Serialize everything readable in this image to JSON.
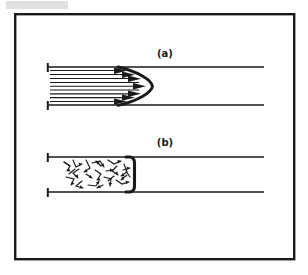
{
  "figure": {
    "background_color": "#ffffff",
    "ink_color": "#161616",
    "frame": {
      "name": "outer-border",
      "x": 14,
      "y": 13,
      "width": 281,
      "height": 247,
      "stroke_width": 2.4,
      "color": "#1a1a1a"
    },
    "panels": [
      {
        "id": "a",
        "label": "(a)",
        "flow_type": "laminar",
        "description": "Parabolic velocity profile with straight parallel streamlines and arrowheads forming a pointed parabolic front",
        "label_position": {
          "x": 165,
          "y": 57
        },
        "pipe": {
          "x_start": 47,
          "x_end": 264,
          "wall_top_y": 67,
          "wall_bottom_y": 105,
          "wall_stroke_width": 1.5,
          "end_tick_height": 9
        },
        "profile": {
          "shape": "parabola",
          "apex_x": 152,
          "base_x": 118,
          "stroke_width": 2.8
        },
        "streamlines": {
          "count": 9,
          "x_start": 50,
          "stroke_width": 1.2,
          "arrow_count": 7
        }
      },
      {
        "id": "b",
        "label": "(b)",
        "flow_type": "turbulent",
        "description": "Blunt flat-topped velocity profile with chaotic zigzag eddy arrows pointing in random directions",
        "label_position": {
          "x": 165,
          "y": 146
        },
        "pipe": {
          "x_start": 47,
          "x_end": 264,
          "wall_top_y": 157,
          "wall_bottom_y": 192,
          "wall_stroke_width": 1.5,
          "end_tick_height": 9
        },
        "profile": {
          "shape": "blunt-flat",
          "front_x": 134,
          "corner_radius": 5,
          "stroke_width": 3.0
        },
        "eddies": {
          "count": 26,
          "region_x_start": 62,
          "region_x_end": 132,
          "stroke_width": 1.1,
          "description": "random zigzag arrow segments"
        }
      }
    ],
    "artifacts": [
      {
        "name": "scan-smudge-top-left",
        "x": 6,
        "y": 1,
        "width": 62,
        "height": 8,
        "color": "#d8d8d8"
      }
    ]
  }
}
